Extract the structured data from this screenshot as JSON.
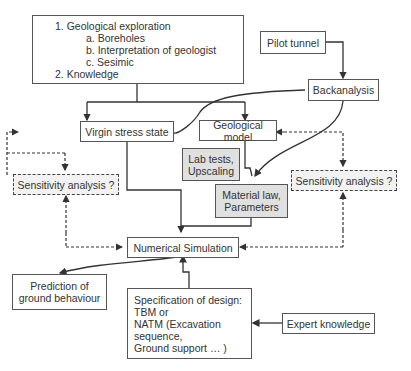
{
  "diagram": {
    "exploration": {
      "lines": [
        "1. Geological exploration",
        "a. Boreholes",
        "b. Interpretation of geologist",
        "c. Sesimic",
        "2. Knowledge"
      ]
    },
    "pilot_tunnel": "Pilot tunnel",
    "backanalysis": "Backanalysis",
    "virgin_stress": "Virgin stress state",
    "geological_model": "Geological model",
    "lab_tests": [
      "Lab tests,",
      "Upscaling"
    ],
    "material_law": [
      "Material law,",
      "Parameters"
    ],
    "sensitivity_left": "Sensitivity analysis ?",
    "sensitivity_right": "Sensitivity analysis ?",
    "numerical_simulation": "Numerical Simulation",
    "prediction": [
      "Prediction of",
      "ground behaviour"
    ],
    "specification": [
      "Specification of design:",
      "TBM or",
      "NATM (Excavation",
      "sequence,",
      "Ground support … )"
    ],
    "expert_knowledge": "Expert knowledge"
  },
  "colors": {
    "line": "#333333",
    "gray_box": "#e0e0e0",
    "dashed_box": "#f2f2f2"
  }
}
